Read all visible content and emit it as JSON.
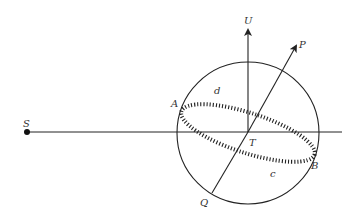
{
  "diagram": {
    "labels": {
      "S": "S",
      "U": "U",
      "P": "P",
      "A": "A",
      "B": "B",
      "c": "c",
      "d": "d",
      "T": "T",
      "Q": "Q"
    },
    "colors": {
      "stroke": "#222222",
      "background": "#ffffff"
    }
  }
}
